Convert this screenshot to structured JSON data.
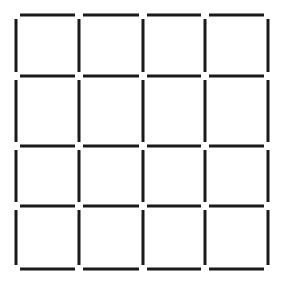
{
  "diagram": {
    "type": "matchstick-grid",
    "rows": 4,
    "cols": 4,
    "stick_color": "#1a1a1a",
    "background": "#ffffff",
    "stick_width": 3,
    "col_lines_x": [
      16,
      79,
      143,
      205,
      268
    ],
    "row_lines_y": [
      15,
      76,
      146,
      206,
      269
    ],
    "gap": 4
  }
}
